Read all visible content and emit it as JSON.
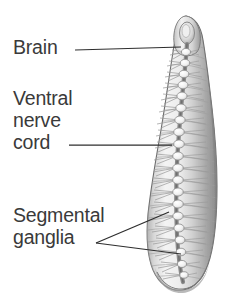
{
  "figure": {
    "background_color": "#ffffff",
    "width": 236,
    "height": 308
  },
  "labels": [
    {
      "id": "brain",
      "text": "Brain",
      "lines": [
        "Brain"
      ],
      "color": "#3a3a3a",
      "leader": {
        "type": "line",
        "from": [
          75,
          50
        ],
        "to": [
          181,
          47
        ]
      }
    },
    {
      "id": "ventral-nerve-cord",
      "text": "Ventral nerve cord",
      "lines": [
        "Ventral",
        "nerve",
        "cord"
      ],
      "color": "#3a3a3a",
      "leader": {
        "type": "line",
        "from": [
          69,
          145
        ],
        "to": [
          172,
          145
        ]
      }
    },
    {
      "id": "segmental-ganglia",
      "text": "Segmental ganglia",
      "lines": [
        "Segmental",
        "ganglia"
      ],
      "color": "#3a3a3a",
      "leader": {
        "type": "fork",
        "apex": [
          96,
          243
        ],
        "to": [
          [
            169,
            212
          ],
          [
            181,
            254
          ]
        ]
      }
    }
  ],
  "specimen": {
    "name": "leech-body",
    "description": "Dorsal view of a leech showing brain, ventral nerve cord and segmental ganglia",
    "colors": {
      "body_light": "#f2f2f2",
      "body_mid": "#c9c9c9",
      "body_shadow": "#8e8e8e",
      "outline": "#6e6e6e",
      "nerve": "#7a7a7a",
      "ganglion": "#fafafa"
    },
    "anatomy": {
      "head_tip": [
        186,
        17
      ],
      "tail_end": [
        182,
        291
      ],
      "ganglia_count": 21
    }
  }
}
